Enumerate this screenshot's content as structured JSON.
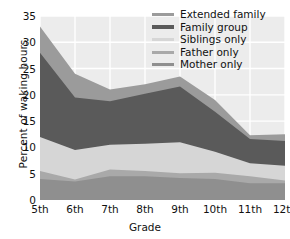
{
  "chart_data": {
    "type": "area",
    "title": "",
    "xlabel": "Grade",
    "ylabel": "Percent of waking hours",
    "categories": [
      "5th",
      "6th",
      "7th",
      "8th",
      "9th",
      "10th",
      "11th",
      "12th"
    ],
    "x": [
      1,
      2,
      3,
      4,
      5,
      6,
      7,
      8
    ],
    "ylim": [
      0,
      35
    ],
    "yticks": [
      0,
      5,
      10,
      15,
      20,
      25,
      30,
      35
    ],
    "grid": true,
    "stacked": true,
    "legend_position": "top-right",
    "series": [
      {
        "name": "Mother only",
        "color": "#8f8f8f",
        "values": [
          4.0,
          3.5,
          4.5,
          4.5,
          4.2,
          4.0,
          3.2,
          3.2
        ]
      },
      {
        "name": "Father only",
        "color": "#a9a9a9",
        "values": [
          1.5,
          0.4,
          1.3,
          1.0,
          0.9,
          1.2,
          1.3,
          0.5
        ]
      },
      {
        "name": "Siblings only",
        "color": "#d6d6d6",
        "values": [
          6.5,
          5.6,
          4.7,
          5.2,
          5.9,
          4.0,
          2.5,
          2.8
        ]
      },
      {
        "name": "Family group",
        "color": "#5a5a5a",
        "values": [
          16.0,
          10.0,
          8.3,
          9.5,
          10.6,
          7.6,
          4.6,
          4.7
        ]
      },
      {
        "name": "Extended family",
        "color": "#9b9b9b",
        "values": [
          5.0,
          4.5,
          2.2,
          1.8,
          1.9,
          2.2,
          0.7,
          1.3
        ]
      }
    ],
    "cumulative_tops": {
      "Mother only": [
        4.0,
        3.5,
        4.5,
        4.5,
        4.2,
        4.0,
        3.2,
        3.2
      ],
      "Father only": [
        5.5,
        3.9,
        5.8,
        5.5,
        5.1,
        5.2,
        4.5,
        3.7
      ],
      "Siblings only": [
        12.0,
        9.5,
        10.5,
        10.7,
        11.0,
        9.2,
        7.0,
        6.5
      ],
      "Family group": [
        28.0,
        19.5,
        18.8,
        20.2,
        21.6,
        16.8,
        11.6,
        11.2
      ],
      "Extended family": [
        33.0,
        24.0,
        21.0,
        22.0,
        23.5,
        19.0,
        12.3,
        12.5
      ]
    }
  },
  "legend": {
    "items": [
      {
        "label": "Extended family"
      },
      {
        "label": "Family group"
      },
      {
        "label": "Siblings only"
      },
      {
        "label": "Father only"
      },
      {
        "label": "Mother only"
      }
    ]
  },
  "colors": {
    "plot_background": "#ececec",
    "gridline": "#ffffff",
    "text": "#111111"
  }
}
